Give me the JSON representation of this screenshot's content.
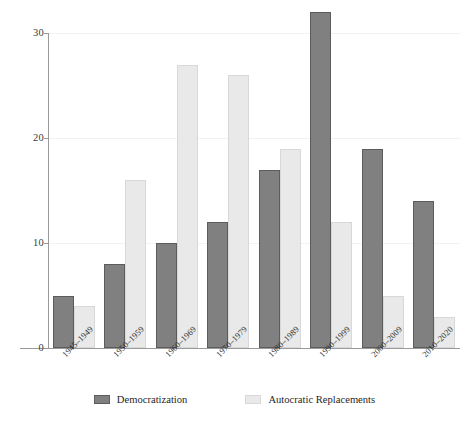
{
  "chart_data": {
    "type": "bar",
    "title": "",
    "subtitle": "",
    "xlabel": "",
    "ylabel": "",
    "ylim": [
      0,
      33
    ],
    "yticks": [
      0,
      10,
      20,
      30
    ],
    "ytick_labels": [
      "0",
      "10",
      "20",
      "30"
    ],
    "grid": true,
    "grid_axis": "y",
    "legend_position": "bottom",
    "categories": [
      "1945–1949",
      "1950–1959",
      "1960–1969",
      "1970–1979",
      "1980–1989",
      "1990–1999",
      "2000–2009",
      "2010–2020"
    ],
    "series": [
      {
        "name": "Democratization",
        "color": "#808080",
        "values": [
          5,
          8,
          10,
          12,
          17,
          32,
          19,
          14
        ]
      },
      {
        "name": "Autocratic Replacements",
        "color": "#e9e9e9",
        "values": [
          4,
          16,
          27,
          26,
          19,
          12,
          5,
          3
        ]
      }
    ]
  },
  "legend": {
    "items": [
      {
        "label": "Democratization",
        "swatch": "dark-swatch"
      },
      {
        "label": "Autocratic Replacements",
        "swatch": "light-swatch"
      }
    ]
  }
}
